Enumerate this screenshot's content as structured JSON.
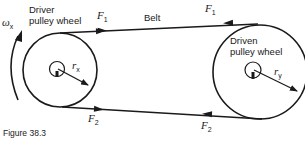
{
  "figure": {
    "caption": "Figure 38.3",
    "colors": {
      "ink": "#1a1a1a",
      "background": "#ffffff"
    }
  },
  "driver_pulley": {
    "label_line1": "Driver",
    "label_line2": "pulley wheel",
    "radius_symbol": "r",
    "radius_subscript": "x",
    "angular_velocity_symbol": "ω",
    "angular_velocity_subscript": "x"
  },
  "driven_pulley": {
    "label_line1": "Driven",
    "label_line2": "pulley wheel",
    "radius_symbol": "r",
    "radius_subscript": "y"
  },
  "belt": {
    "label": "Belt",
    "top_force_left": {
      "symbol": "F",
      "subscript": "1"
    },
    "top_force_right": {
      "symbol": "F",
      "subscript": "1"
    },
    "bottom_force_left": {
      "symbol": "F",
      "subscript": "2"
    },
    "bottom_force_right": {
      "symbol": "F",
      "subscript": "2"
    }
  }
}
